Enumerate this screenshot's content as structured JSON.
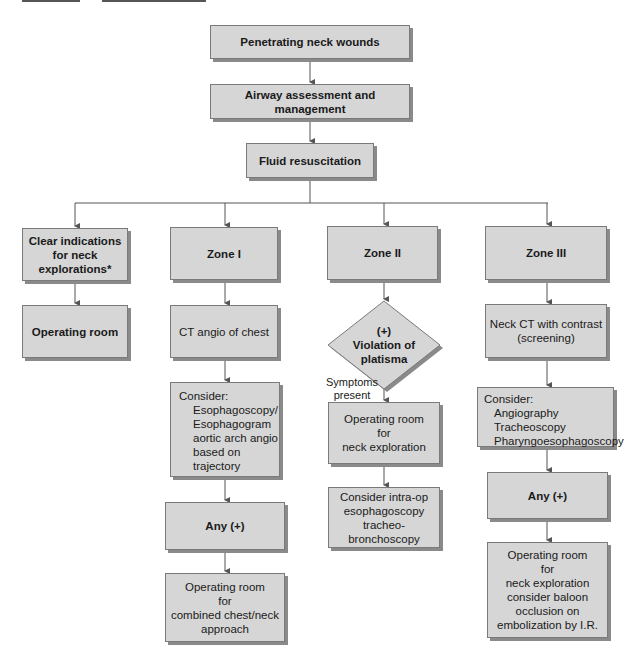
{
  "flowchart": {
    "top": {
      "step1": "Penetrating neck wounds",
      "step2": "Airway assessment and management",
      "step3": "Fluid resuscitation"
    },
    "col_clear": {
      "header": [
        "Clear indications",
        "for neck",
        "explorations*"
      ],
      "result": "Operating room"
    },
    "col_zone1": {
      "header": "Zone I",
      "step1": "CT angio of chest",
      "consider_title": "Consider:",
      "consider_items": [
        "Esophagoscopy/",
        "Esophagogram",
        "aortic arch angio",
        "based on",
        "trajectory"
      ],
      "decision": "Any (+)",
      "result": [
        "Operating room",
        "for",
        "combined chest/neck",
        "approach"
      ]
    },
    "col_zone2": {
      "header": "Zone II",
      "diamond": [
        "(+)",
        "Violation of",
        "platisma"
      ],
      "edge_label": [
        "Symptoms",
        "present"
      ],
      "result": [
        "Operating room",
        "for",
        "neck exploration"
      ],
      "followup": [
        "Consider intra-op",
        "esophagoscopy",
        "tracheo-",
        "bronchoscopy"
      ]
    },
    "col_zone3": {
      "header": "Zone III",
      "step1": [
        "Neck CT with contrast",
        "(screening)"
      ],
      "consider_title": "Consider:",
      "consider_items": [
        "Angiography",
        "Tracheoscopy",
        "Pharyngoesophagoscopy"
      ],
      "decision": "Any (+)",
      "result": [
        "Operating room",
        "for",
        "neck exploration",
        "consider baloon",
        "occlusion on",
        "embolization by I.R."
      ]
    }
  },
  "colors": {
    "box_fill": "#d6d6d6",
    "box_border": "#7a7a7a",
    "shadow": "#8a8a8a",
    "line": "#555555"
  }
}
